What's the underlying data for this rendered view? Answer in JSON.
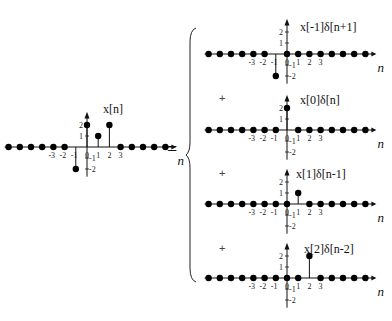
{
  "equals_sign": "=",
  "plus_sign": "+",
  "chart_data": [
    {
      "type": "stem",
      "title": "x[n]",
      "xlabel": "n",
      "x": [
        -7,
        -6,
        -5,
        -4,
        -3,
        -2,
        -1,
        0,
        1,
        2,
        3,
        4,
        5,
        6,
        7
      ],
      "values": [
        0,
        0,
        0,
        0,
        0,
        0,
        -2,
        2,
        1,
        2,
        0,
        0,
        0,
        0,
        0
      ],
      "x_tick_labels": [
        "-3",
        "-2",
        "-1",
        "0",
        "1",
        "2",
        "3"
      ],
      "y_tick_labels": [
        "2",
        "1",
        "-1",
        "-2"
      ]
    },
    {
      "type": "stem",
      "title": "x[-1]δ[n+1]",
      "xlabel": "n",
      "x": [
        -7,
        -6,
        -5,
        -4,
        -3,
        -2,
        -1,
        0,
        1,
        2,
        3,
        4,
        5,
        6,
        7
      ],
      "values": [
        0,
        0,
        0,
        0,
        0,
        0,
        -2,
        0,
        0,
        0,
        0,
        0,
        0,
        0,
        0
      ],
      "x_tick_labels": [
        "-3",
        "-2",
        "-1",
        "0",
        "1",
        "2",
        "3"
      ],
      "y_tick_labels": [
        "2",
        "1",
        "-1",
        "-2"
      ]
    },
    {
      "type": "stem",
      "title": "x[0]δ[n]",
      "xlabel": "n",
      "x": [
        -7,
        -6,
        -5,
        -4,
        -3,
        -2,
        -1,
        0,
        1,
        2,
        3,
        4,
        5,
        6,
        7
      ],
      "values": [
        0,
        0,
        0,
        0,
        0,
        0,
        0,
        2,
        0,
        0,
        0,
        0,
        0,
        0,
        0
      ],
      "x_tick_labels": [
        "-3",
        "-2",
        "-1",
        "0",
        "1",
        "2",
        "3"
      ],
      "y_tick_labels": [
        "2",
        "1",
        "-1",
        "-2"
      ]
    },
    {
      "type": "stem",
      "title": "x[1]δ[n-1]",
      "xlabel": "n",
      "x": [
        -7,
        -6,
        -5,
        -4,
        -3,
        -2,
        -1,
        0,
        1,
        2,
        3,
        4,
        5,
        6,
        7
      ],
      "values": [
        0,
        0,
        0,
        0,
        0,
        0,
        0,
        0,
        1,
        0,
        0,
        0,
        0,
        0,
        0
      ],
      "x_tick_labels": [
        "-3",
        "-2",
        "-1",
        "0",
        "1",
        "2",
        "3"
      ],
      "y_tick_labels": [
        "2",
        "1",
        "-1",
        "-2"
      ]
    },
    {
      "type": "stem",
      "title": "x[2]δ[n-2]",
      "xlabel": "n",
      "x": [
        -7,
        -6,
        -5,
        -4,
        -3,
        -2,
        -1,
        0,
        1,
        2,
        3,
        4,
        5,
        6,
        7
      ],
      "values": [
        0,
        0,
        0,
        0,
        0,
        0,
        0,
        0,
        0,
        2,
        0,
        0,
        0,
        0,
        0
      ],
      "x_tick_labels": [
        "-3",
        "-2",
        "-1",
        "0",
        "1",
        "2",
        "3"
      ],
      "y_tick_labels": [
        "2",
        "1",
        "-1",
        "-2"
      ]
    }
  ]
}
